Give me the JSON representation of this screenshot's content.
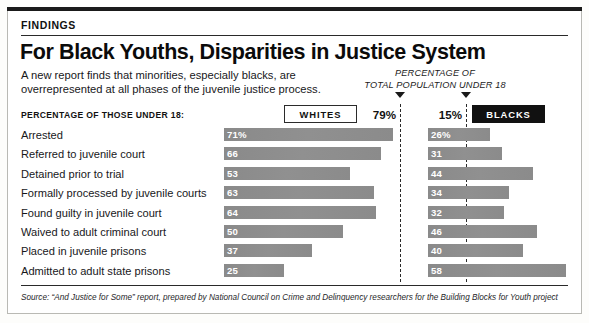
{
  "frame": {
    "kicker": "FINDINGS",
    "headline": "For Black Youths, Disparities in Justice System",
    "deck": "A new report finds that minorities, especially blacks, are overrepresented at all phases of the juvenile justice process.",
    "source": "Source: “And Justice for Some” report, prepared by National Council on Crime and Delinquency researchers for the Building Blocks for Youth project"
  },
  "annotation": {
    "population_note_line1": "PERCENTAGE OF",
    "population_note_line2": "TOTAL POPULATION UNDER 18",
    "whites_population_pct": "79%",
    "blacks_population_pct": "15%",
    "caret_left_icon": "caret-down-icon",
    "caret_right_icon": "caret-down-icon"
  },
  "legend": {
    "column_header": "PERCENTAGE OF THOSE UNDER 18:",
    "whites_label": "WHITES",
    "blacks_label": "BLACKS"
  },
  "colors": {
    "bar_gray": "#8e8e8e",
    "ink": "#111111",
    "paper": "#ffffff",
    "rule": "#2a2a2a"
  },
  "chart_data": {
    "type": "bar",
    "title": "For Black Youths, Disparities in Justice System",
    "subtitle": "A new report finds that minorities, especially blacks, are overrepresented at all phases of the juvenile justice process.",
    "orientation": "horizontal",
    "layout": "diverging-paired-back-to-back",
    "xlabel": "",
    "ylabel": "",
    "unit": "percent",
    "xlim": [
      0,
      71
    ],
    "grid": false,
    "legend_position": "top",
    "reference_lines": [
      {
        "series": "Whites",
        "label": "79%",
        "value": 79,
        "note": "PERCENTAGE OF TOTAL POPULATION UNDER 18"
      },
      {
        "series": "Blacks",
        "label": "15%",
        "value": 15,
        "note": "PERCENTAGE OF TOTAL POPULATION UNDER 18"
      }
    ],
    "categories": [
      "Arrested",
      "Referred to juvenile court",
      "Detained prior to trial",
      "Formally processed by juvenile courts",
      "Found guilty in juvenile court",
      "Waived to adult criminal court",
      "Placed in juvenile prisons",
      "Admitted to adult state prisons"
    ],
    "series": [
      {
        "name": "WHITES",
        "values": [
          71,
          66,
          53,
          63,
          64,
          50,
          37,
          25
        ],
        "labels": [
          "71%",
          "66",
          "53",
          "63",
          "64",
          "50",
          "37",
          "25"
        ]
      },
      {
        "name": "BLACKS",
        "values": [
          26,
          31,
          44,
          34,
          32,
          46,
          40,
          58
        ],
        "labels": [
          "26%",
          "31",
          "44",
          "34",
          "32",
          "46",
          "40",
          "58"
        ]
      }
    ]
  }
}
